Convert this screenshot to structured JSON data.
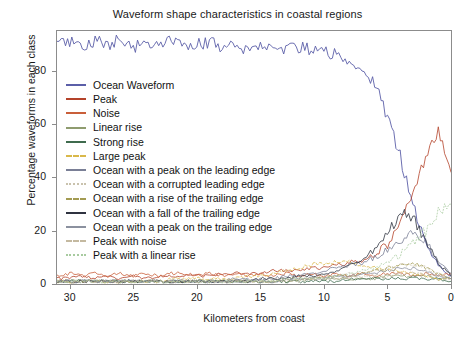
{
  "chart_data": {
    "type": "line",
    "title": "Waveform shape characteristics in coastal regions",
    "xlabel": "Kilometers from coast",
    "ylabel": "Percentage waveforms in each class",
    "xlim": [
      31,
      0
    ],
    "ylim": [
      0,
      95
    ],
    "x_ticks": [
      30,
      25,
      20,
      15,
      10,
      5,
      0
    ],
    "y_ticks": [
      0,
      20,
      40,
      60,
      80
    ],
    "x_reversed": true,
    "grid": false,
    "legend_position": "upper-left-inside",
    "x": [
      31,
      30,
      29,
      28,
      27,
      26,
      25,
      24,
      23,
      22,
      21,
      20,
      19,
      18,
      17,
      16,
      15,
      14,
      13,
      12,
      11,
      10,
      9,
      8,
      7,
      6,
      5,
      4,
      3,
      2,
      1,
      0
    ],
    "series": [
      {
        "name": "Ocean Waveform",
        "color": "#5b5fa8",
        "dash": "solid",
        "values": [
          90,
          91,
          89,
          91,
          90,
          92,
          89,
          91,
          90,
          91,
          89,
          90,
          91,
          89,
          90,
          88,
          90,
          89,
          88,
          89,
          88,
          87,
          86,
          84,
          81,
          75,
          63,
          48,
          30,
          16,
          7,
          3
        ]
      },
      {
        "name": "Peak",
        "color": "#b4432a",
        "dash": "solid",
        "values": [
          2,
          2,
          3,
          2,
          3,
          2,
          3,
          2,
          3,
          3,
          3,
          3,
          3,
          4,
          4,
          4,
          4,
          5,
          5,
          5,
          6,
          6,
          7,
          8,
          9,
          11,
          15,
          22,
          34,
          47,
          57,
          42
        ]
      },
      {
        "name": "Noise",
        "color": "#c95f3a",
        "dash": "solid",
        "values": [
          3,
          4,
          3,
          4,
          3,
          4,
          3,
          4,
          3,
          4,
          4,
          3,
          4,
          3,
          4,
          3,
          4,
          3,
          4,
          3,
          4,
          3,
          4,
          3,
          4,
          3,
          4,
          4,
          3,
          4,
          3,
          4
        ]
      },
      {
        "name": "Linear rise",
        "color": "#8f9c6f",
        "dash": "solid",
        "values": [
          1,
          1,
          1,
          1,
          1,
          1,
          1,
          1,
          1,
          1,
          1,
          1,
          1,
          1,
          1,
          1,
          1,
          1,
          1,
          1,
          2,
          2,
          2,
          2,
          2,
          2,
          3,
          3,
          3,
          3,
          2,
          2
        ]
      },
      {
        "name": "Strong rise",
        "color": "#3f6b4e",
        "dash": "solid",
        "values": [
          1,
          1,
          1,
          1,
          1,
          1,
          1,
          1,
          1,
          1,
          1,
          1,
          1,
          1,
          1,
          1,
          1,
          1,
          1,
          1,
          1,
          1,
          1,
          2,
          2,
          2,
          2,
          2,
          2,
          2,
          2,
          1
        ]
      },
      {
        "name": "Large peak",
        "color": "#d9b84a",
        "dash": "dashed",
        "values": [
          1,
          1,
          1,
          1,
          1,
          1,
          1,
          1,
          1,
          2,
          2,
          2,
          2,
          2,
          2,
          3,
          3,
          4,
          5,
          6,
          7,
          8,
          8,
          8,
          7,
          6,
          5,
          5,
          4,
          3,
          2,
          2
        ]
      },
      {
        "name": "Ocean with a peak on the leading edge",
        "color": "#7a7f96",
        "dash": "solid",
        "values": [
          1,
          1,
          1,
          1,
          1,
          1,
          1,
          1,
          1,
          1,
          1,
          1,
          1,
          1,
          2,
          2,
          2,
          2,
          3,
          3,
          4,
          5,
          6,
          7,
          8,
          10,
          13,
          17,
          20,
          16,
          8,
          4
        ]
      },
      {
        "name": "Ocean with a corrupted leading edge",
        "color": "#c9c2ad",
        "dash": "dotted",
        "values": [
          1,
          1,
          1,
          1,
          1,
          1,
          1,
          1,
          1,
          1,
          1,
          1,
          1,
          1,
          1,
          1,
          1,
          2,
          2,
          2,
          2,
          3,
          3,
          4,
          4,
          5,
          6,
          7,
          7,
          6,
          4,
          2
        ]
      },
      {
        "name": "Ocean with a rise of the trailing edge",
        "color": "#a39b52",
        "dash": "dashed",
        "values": [
          1,
          1,
          1,
          1,
          1,
          1,
          1,
          1,
          1,
          1,
          1,
          1,
          1,
          1,
          1,
          1,
          1,
          1,
          2,
          2,
          2,
          2,
          3,
          3,
          4,
          5,
          6,
          7,
          8,
          6,
          4,
          2
        ]
      },
      {
        "name": "Ocean with a fall of the trailing edge",
        "color": "#2f3340",
        "dash": "solid",
        "values": [
          1,
          1,
          1,
          1,
          1,
          1,
          1,
          1,
          1,
          1,
          1,
          1,
          1,
          1,
          1,
          1,
          2,
          2,
          2,
          3,
          3,
          4,
          5,
          7,
          9,
          13,
          19,
          26,
          25,
          17,
          8,
          3
        ]
      },
      {
        "name": "Ocean with a peak on the trailing edge",
        "color": "#8b919f",
        "dash": "solid",
        "values": [
          1,
          1,
          1,
          1,
          1,
          1,
          1,
          1,
          1,
          1,
          1,
          1,
          1,
          1,
          1,
          1,
          1,
          1,
          2,
          2,
          2,
          2,
          3,
          3,
          4,
          4,
          5,
          6,
          6,
          5,
          3,
          2
        ]
      },
      {
        "name": "Peak with noise",
        "color": "#c4b9a0",
        "dash": "dashdot",
        "values": [
          1,
          1,
          1,
          1,
          1,
          1,
          1,
          1,
          1,
          1,
          1,
          1,
          1,
          1,
          1,
          1,
          1,
          1,
          1,
          1,
          2,
          2,
          2,
          2,
          3,
          3,
          3,
          4,
          4,
          4,
          3,
          2
        ]
      },
      {
        "name": "Peak with a linear rise",
        "color": "#a8cba0",
        "dash": "dotted",
        "values": [
          1,
          1,
          1,
          1,
          1,
          1,
          1,
          1,
          1,
          1,
          1,
          1,
          1,
          1,
          1,
          1,
          1,
          1,
          2,
          2,
          2,
          2,
          3,
          4,
          5,
          6,
          8,
          11,
          15,
          20,
          27,
          30
        ]
      }
    ]
  },
  "axes": {
    "x_tick_labels": [
      "30",
      "25",
      "20",
      "15",
      "10",
      "5",
      "0"
    ],
    "y_tick_labels": [
      "80",
      "60",
      "40",
      "20",
      "0"
    ]
  }
}
